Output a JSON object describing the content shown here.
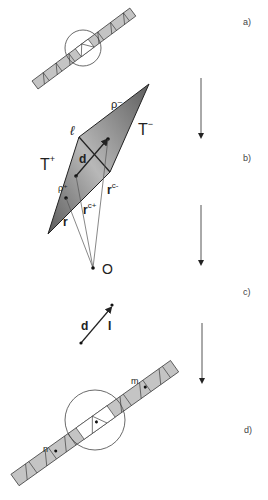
{
  "panels": {
    "a": {
      "label": "a)"
    },
    "b": {
      "label": "b)",
      "edge_label": "ℓ",
      "rho_minus": "ρ⁻",
      "t_minus": "T",
      "t_minus_sup": "−",
      "t_plus": "T",
      "t_plus_sup": "+",
      "rho_plus": "ρ⁺",
      "d_label": "d",
      "r_label": "r",
      "rc_plus": "r",
      "rc_plus_sup": "c+",
      "rc_minus": "r",
      "rc_minus_sup": "c-",
      "origin": "O"
    },
    "c": {
      "label": "c)",
      "d_label": "d",
      "i_label": "I"
    },
    "d": {
      "label": "d)",
      "n_label": "n",
      "m_label": "m"
    }
  },
  "colors": {
    "fill_light": "#c4c4c4",
    "fill_dark": "#6a6a6a",
    "stroke": "#333333"
  }
}
